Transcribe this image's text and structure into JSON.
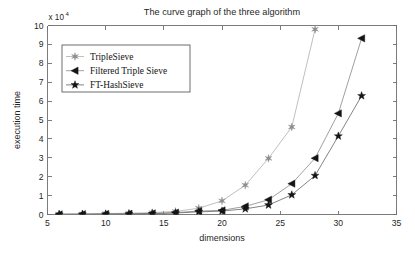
{
  "figure": {
    "title": "The curve graph of the three algorithm",
    "xlabel": "dimensions",
    "ylabel": "execution time",
    "exponent_prefix": "x 10",
    "exponent_power": "4"
  },
  "axes": {
    "x_ticks": [
      "5",
      "10",
      "15",
      "20",
      "25",
      "30",
      "35"
    ],
    "y_ticks": [
      "0",
      "1",
      "2",
      "3",
      "4",
      "5",
      "6",
      "7",
      "8",
      "9",
      "10"
    ]
  },
  "legend": {
    "items": [
      {
        "label": "TripleSieve",
        "marker": "six-point-star-icon",
        "color": "#8c8c8c"
      },
      {
        "label": "Filtered Triple Sieve",
        "marker": "left-triangle-icon",
        "color": "#141414"
      },
      {
        "label": "FT-HashSieve",
        "marker": "five-point-star-icon",
        "color": "#141414"
      }
    ]
  },
  "chart_data": {
    "type": "line",
    "title": "The curve graph of the three algorithm",
    "xlabel": "dimensions",
    "ylabel": "execution time",
    "y_scale_factor": 10000,
    "y_scale_label": "x 10^4",
    "xlim": [
      5,
      35
    ],
    "ylim": [
      0,
      10
    ],
    "xticks": [
      5,
      10,
      15,
      20,
      25,
      30,
      35
    ],
    "yticks": [
      0,
      1,
      2,
      3,
      4,
      5,
      6,
      7,
      8,
      9,
      10
    ],
    "grid": false,
    "legend_position": "upper left",
    "series": [
      {
        "name": "TripleSieve",
        "marker": "six-point-star",
        "color": "#8c8c8c",
        "line_color": "#b4b4b4",
        "x": [
          6,
          8,
          10,
          12,
          14,
          16,
          18,
          20,
          22,
          24,
          26,
          28
        ],
        "values": [
          0.02,
          0.03,
          0.05,
          0.07,
          0.1,
          0.16,
          0.33,
          0.72,
          1.55,
          2.97,
          4.63,
          9.8
        ]
      },
      {
        "name": "Filtered Triple Sieve",
        "marker": "left-triangle",
        "color": "#141414",
        "line_color": "#8f8f8f",
        "x": [
          6,
          8,
          10,
          12,
          14,
          16,
          18,
          20,
          22,
          24,
          26,
          28,
          30,
          32
        ],
        "values": [
          0.01,
          0.02,
          0.03,
          0.04,
          0.06,
          0.1,
          0.18,
          0.22,
          0.43,
          0.78,
          1.63,
          2.98,
          5.35,
          9.32
        ]
      },
      {
        "name": "FT-HashSieve",
        "marker": "five-point-star",
        "color": "#141414",
        "line_color": "#6e6e6e",
        "x": [
          6,
          8,
          10,
          12,
          14,
          16,
          18,
          20,
          22,
          24,
          26,
          28,
          30,
          32
        ],
        "values": [
          0.01,
          0.015,
          0.02,
          0.03,
          0.045,
          0.08,
          0.14,
          0.18,
          0.3,
          0.5,
          1.04,
          2.06,
          4.15,
          6.28
        ]
      }
    ]
  }
}
